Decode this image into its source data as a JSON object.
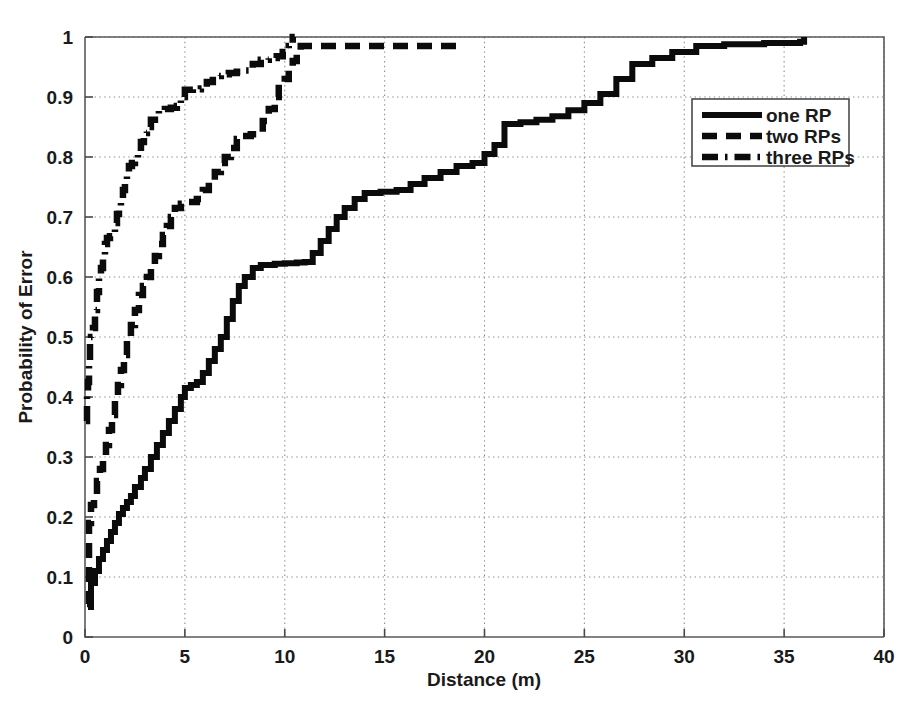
{
  "chart_data": {
    "type": "line",
    "title": "",
    "subtitle": "",
    "xlabel": "Distance (m)",
    "ylabel": "Probability of Error",
    "xlim": [
      0,
      40
    ],
    "ylim": [
      0,
      1
    ],
    "xticks": [
      0,
      5,
      10,
      15,
      20,
      25,
      30,
      35,
      40
    ],
    "xtick_labels": [
      "0",
      "5",
      "10",
      "15",
      "20",
      "25",
      "30",
      "35",
      "40"
    ],
    "yticks": [
      0,
      0.1,
      0.2,
      0.3,
      0.4,
      0.5,
      0.6,
      0.7,
      0.8,
      0.9,
      1
    ],
    "ytick_labels": [
      "0",
      "0.1",
      "0.2",
      "0.3",
      "0.4",
      "0.5",
      "0.6",
      "0.7",
      "0.8",
      "0.9",
      "1"
    ],
    "grid": true,
    "grid_style": "dotted",
    "legend_position": "right-top",
    "legend_entries": [
      "one RP",
      "two RPs",
      "three RPs"
    ],
    "series": [
      {
        "name": "one RP",
        "style": "solid",
        "color": "#0b0b0b",
        "points": [
          [
            0.15,
            0.05
          ],
          [
            0.3,
            0.09
          ],
          [
            0.5,
            0.11
          ],
          [
            0.7,
            0.13
          ],
          [
            0.9,
            0.145
          ],
          [
            1.1,
            0.16
          ],
          [
            1.3,
            0.175
          ],
          [
            1.5,
            0.19
          ],
          [
            1.7,
            0.205
          ],
          [
            1.9,
            0.215
          ],
          [
            2.1,
            0.225
          ],
          [
            2.3,
            0.235
          ],
          [
            2.5,
            0.25
          ],
          [
            2.8,
            0.265
          ],
          [
            3.0,
            0.28
          ],
          [
            3.3,
            0.3
          ],
          [
            3.6,
            0.32
          ],
          [
            3.9,
            0.34
          ],
          [
            4.2,
            0.36
          ],
          [
            4.5,
            0.38
          ],
          [
            4.8,
            0.4
          ],
          [
            5.0,
            0.415
          ],
          [
            5.3,
            0.42
          ],
          [
            5.6,
            0.425
          ],
          [
            5.9,
            0.44
          ],
          [
            6.2,
            0.46
          ],
          [
            6.5,
            0.48
          ],
          [
            6.8,
            0.5
          ],
          [
            7.1,
            0.53
          ],
          [
            7.4,
            0.56
          ],
          [
            7.7,
            0.585
          ],
          [
            8.0,
            0.6
          ],
          [
            8.4,
            0.615
          ],
          [
            8.8,
            0.62
          ],
          [
            9.5,
            0.622
          ],
          [
            10.0,
            0.623
          ],
          [
            10.6,
            0.624
          ],
          [
            11.0,
            0.625
          ],
          [
            11.4,
            0.64
          ],
          [
            11.8,
            0.66
          ],
          [
            12.2,
            0.68
          ],
          [
            12.6,
            0.7
          ],
          [
            13.0,
            0.715
          ],
          [
            13.5,
            0.73
          ],
          [
            14.0,
            0.74
          ],
          [
            14.8,
            0.742
          ],
          [
            15.6,
            0.745
          ],
          [
            16.3,
            0.755
          ],
          [
            17.0,
            0.765
          ],
          [
            17.8,
            0.775
          ],
          [
            18.6,
            0.785
          ],
          [
            19.4,
            0.79
          ],
          [
            20.0,
            0.805
          ],
          [
            20.5,
            0.82
          ],
          [
            21.0,
            0.855
          ],
          [
            21.8,
            0.858
          ],
          [
            22.6,
            0.862
          ],
          [
            23.4,
            0.868
          ],
          [
            24.2,
            0.878
          ],
          [
            25.0,
            0.89
          ],
          [
            25.8,
            0.905
          ],
          [
            26.6,
            0.93
          ],
          [
            27.4,
            0.955
          ],
          [
            28.4,
            0.965
          ],
          [
            29.4,
            0.975
          ],
          [
            30.6,
            0.985
          ],
          [
            32.0,
            0.988
          ],
          [
            34.0,
            0.99
          ],
          [
            35.8,
            0.992
          ],
          [
            36.0,
            1.0
          ],
          [
            36.0,
            1.0
          ]
        ]
      },
      {
        "name": "two RPs",
        "style": "dashed",
        "color": "#0b0b0b",
        "points": [
          [
            0.1,
            0.055
          ],
          [
            0.2,
            0.19
          ],
          [
            0.3,
            0.22
          ],
          [
            0.45,
            0.235
          ],
          [
            0.6,
            0.26
          ],
          [
            0.75,
            0.28
          ],
          [
            0.9,
            0.3
          ],
          [
            1.05,
            0.32
          ],
          [
            1.2,
            0.345
          ],
          [
            1.35,
            0.37
          ],
          [
            1.5,
            0.395
          ],
          [
            1.65,
            0.42
          ],
          [
            1.8,
            0.445
          ],
          [
            1.95,
            0.47
          ],
          [
            2.1,
            0.495
          ],
          [
            2.3,
            0.52
          ],
          [
            2.5,
            0.545
          ],
          [
            2.7,
            0.57
          ],
          [
            2.9,
            0.585
          ],
          [
            3.1,
            0.6
          ],
          [
            3.3,
            0.615
          ],
          [
            3.5,
            0.635
          ],
          [
            3.7,
            0.655
          ],
          [
            3.9,
            0.67
          ],
          [
            4.1,
            0.685
          ],
          [
            4.3,
            0.7
          ],
          [
            4.5,
            0.715
          ],
          [
            4.8,
            0.722
          ],
          [
            5.2,
            0.725
          ],
          [
            5.6,
            0.73
          ],
          [
            5.9,
            0.745
          ],
          [
            6.2,
            0.76
          ],
          [
            6.5,
            0.775
          ],
          [
            6.8,
            0.79
          ],
          [
            7.0,
            0.8
          ],
          [
            7.3,
            0.815
          ],
          [
            7.6,
            0.83
          ],
          [
            7.9,
            0.835
          ],
          [
            8.3,
            0.838
          ],
          [
            8.6,
            0.842
          ],
          [
            8.9,
            0.86
          ],
          [
            9.2,
            0.88
          ],
          [
            9.5,
            0.9
          ],
          [
            9.7,
            0.915
          ],
          [
            10.0,
            0.93
          ],
          [
            10.2,
            0.945
          ],
          [
            10.4,
            0.96
          ],
          [
            10.6,
            0.975
          ],
          [
            10.8,
            0.985
          ],
          [
            11.5,
            0.985
          ],
          [
            13.0,
            0.985
          ],
          [
            15.0,
            0.985
          ],
          [
            17.0,
            0.985
          ],
          [
            18.6,
            0.985
          ]
        ]
      },
      {
        "name": "three RPs",
        "style": "dashdot",
        "color": "#0b0b0b",
        "points": [
          [
            0.05,
            0.36
          ],
          [
            0.1,
            0.41
          ],
          [
            0.15,
            0.425
          ],
          [
            0.2,
            0.46
          ],
          [
            0.25,
            0.49
          ],
          [
            0.3,
            0.5
          ],
          [
            0.4,
            0.515
          ],
          [
            0.5,
            0.545
          ],
          [
            0.6,
            0.575
          ],
          [
            0.7,
            0.6
          ],
          [
            0.8,
            0.615
          ],
          [
            0.9,
            0.635
          ],
          [
            1.0,
            0.655
          ],
          [
            1.1,
            0.665
          ],
          [
            1.25,
            0.668
          ],
          [
            1.4,
            0.672
          ],
          [
            1.5,
            0.69
          ],
          [
            1.6,
            0.705
          ],
          [
            1.7,
            0.718
          ],
          [
            1.8,
            0.73
          ],
          [
            1.9,
            0.745
          ],
          [
            2.0,
            0.76
          ],
          [
            2.1,
            0.775
          ],
          [
            2.2,
            0.785
          ],
          [
            2.35,
            0.79
          ],
          [
            2.5,
            0.795
          ],
          [
            2.65,
            0.81
          ],
          [
            2.8,
            0.825
          ],
          [
            2.95,
            0.84
          ],
          [
            3.1,
            0.85
          ],
          [
            3.3,
            0.862
          ],
          [
            3.5,
            0.872
          ],
          [
            3.7,
            0.878
          ],
          [
            4.0,
            0.88
          ],
          [
            4.3,
            0.882
          ],
          [
            4.6,
            0.885
          ],
          [
            4.8,
            0.9
          ],
          [
            5.0,
            0.912
          ],
          [
            5.4,
            0.913
          ],
          [
            5.8,
            0.914
          ],
          [
            6.1,
            0.925
          ],
          [
            6.4,
            0.935
          ],
          [
            6.8,
            0.938
          ],
          [
            7.2,
            0.94
          ],
          [
            7.6,
            0.942
          ],
          [
            8.0,
            0.944
          ],
          [
            8.4,
            0.955
          ],
          [
            8.8,
            0.962
          ],
          [
            9.2,
            0.965
          ],
          [
            9.6,
            0.968
          ],
          [
            9.9,
            0.975
          ],
          [
            10.2,
            0.985
          ],
          [
            10.4,
            1.0
          ],
          [
            10.5,
            1.0
          ]
        ]
      }
    ]
  },
  "axes": {
    "x_title": "Distance (m)",
    "y_title": "Probability of Error"
  },
  "legend": {
    "items": [
      {
        "label": "one RP",
        "style": "solid"
      },
      {
        "label": "two RPs",
        "style": "dashed"
      },
      {
        "label": "three RPs",
        "style": "dashdot"
      }
    ]
  },
  "colors": {
    "line": "#0b0b0b",
    "axis": "#5a5a5a",
    "grid": "#8c8c8c",
    "background": "#ffffff"
  }
}
